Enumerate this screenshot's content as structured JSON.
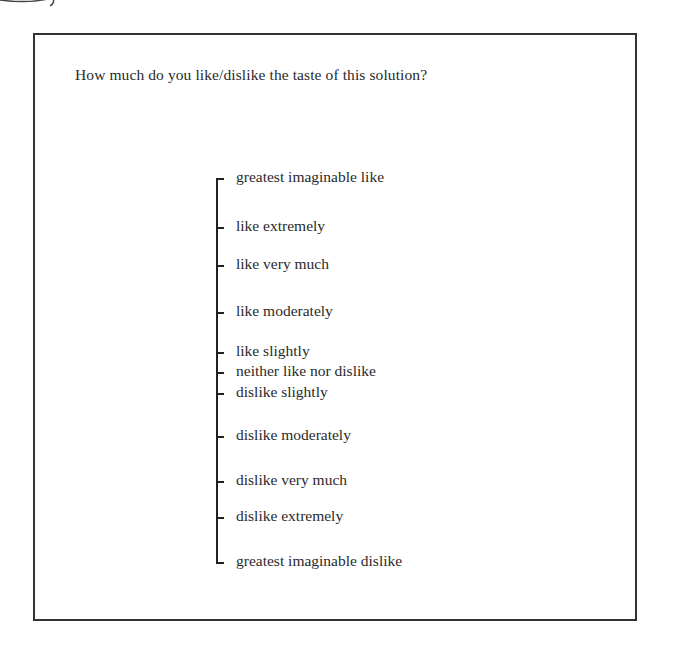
{
  "question": "How much do you like/dislike the taste of this solution?",
  "scale": {
    "items": [
      {
        "label": "greatest imaginable like",
        "y": 179
      },
      {
        "label": "like extremely",
        "y": 228
      },
      {
        "label": "like very much",
        "y": 266
      },
      {
        "label": "like moderately",
        "y": 313
      },
      {
        "label": "like slightly",
        "y": 353
      },
      {
        "label": "neither like nor dislike",
        "y": 373
      },
      {
        "label": "dislike slightly",
        "y": 394
      },
      {
        "label": "dislike moderately",
        "y": 437
      },
      {
        "label": "dislike very much",
        "y": 482
      },
      {
        "label": "dislike extremely",
        "y": 518
      },
      {
        "label": "greatest imaginable dislike",
        "y": 563
      }
    ]
  }
}
